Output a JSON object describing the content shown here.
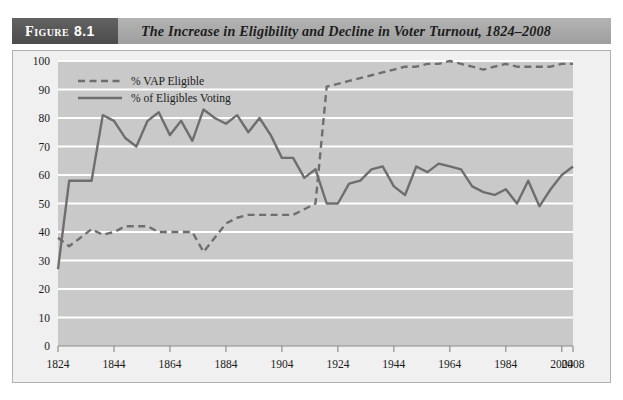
{
  "figure": {
    "tag_word": "Figure",
    "tag_number": "8.1",
    "title": "The Increase in Eligibility and Decline in Voter Turnout, 1824–2008"
  },
  "colors": {
    "plot_background": "#c9c9c9",
    "gridline": "#ffffff",
    "series_line": "#6e6e6e",
    "header_band": "#a8a8a8",
    "header_tag": "#565656",
    "frame_background": "#f0f0f0",
    "frame_border": "#b0b0b0",
    "text": "#1b1b1b"
  },
  "chart_data": {
    "type": "line",
    "title": "The Increase in Eligibility and Decline in Voter Turnout, 1824–2008",
    "xlabel": "",
    "ylabel": "",
    "xlim": [
      1824,
      2008
    ],
    "ylim": [
      0,
      100
    ],
    "grid": true,
    "legend_position": "top-left",
    "xticks": [
      1824,
      1844,
      1864,
      1884,
      1904,
      1924,
      1944,
      1964,
      1984,
      2004,
      2008
    ],
    "xtick_labels": [
      "1824",
      "1844",
      "1864",
      "1884",
      "1904",
      "1924",
      "1944",
      "1964",
      "1984",
      "2004",
      "2008"
    ],
    "yticks": [
      0,
      10,
      20,
      30,
      40,
      50,
      60,
      70,
      80,
      90,
      100
    ],
    "ytick_labels": [
      "0",
      "10",
      "20",
      "30",
      "40",
      "50",
      "60",
      "70",
      "80",
      "90",
      "100"
    ],
    "x": [
      1824,
      1828,
      1832,
      1836,
      1840,
      1844,
      1848,
      1852,
      1856,
      1860,
      1864,
      1868,
      1872,
      1876,
      1880,
      1884,
      1888,
      1892,
      1896,
      1900,
      1904,
      1908,
      1912,
      1916,
      1920,
      1924,
      1928,
      1932,
      1936,
      1940,
      1944,
      1948,
      1952,
      1956,
      1960,
      1964,
      1968,
      1972,
      1976,
      1980,
      1984,
      1988,
      1992,
      1996,
      2000,
      2004,
      2008
    ],
    "series": [
      {
        "name": "% VAP Eligible",
        "style": "dashed",
        "color": "#6e6e6e",
        "values": [
          38,
          35,
          38,
          41,
          39,
          40,
          42,
          42,
          42,
          40,
          40,
          40,
          40,
          33,
          38,
          43,
          45,
          46,
          46,
          46,
          46,
          46,
          48,
          50,
          91,
          92,
          93,
          94,
          95,
          96,
          97,
          98,
          98,
          99,
          99,
          100,
          99,
          98,
          97,
          98,
          99,
          98,
          98,
          98,
          98,
          99,
          99
        ]
      },
      {
        "name": "% of Eligibles Voting",
        "style": "solid",
        "color": "#6e6e6e",
        "values": [
          27,
          58,
          58,
          58,
          81,
          79,
          73,
          70,
          79,
          82,
          74,
          79,
          72,
          83,
          80,
          78,
          81,
          75,
          80,
          74,
          66,
          66,
          59,
          62,
          50,
          50,
          57,
          58,
          62,
          63,
          56,
          53,
          63,
          61,
          64,
          63,
          62,
          56,
          54,
          53,
          55,
          50,
          58,
          49,
          55,
          60,
          63
        ]
      }
    ]
  },
  "legend": {
    "items": [
      {
        "label": "% VAP Eligible",
        "style": "dashed"
      },
      {
        "label": "% of Eligibles Voting",
        "style": "solid"
      }
    ]
  }
}
